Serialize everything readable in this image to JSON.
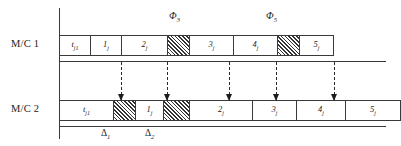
{
  "diagram": {
    "machines": [
      {
        "id": "mc1",
        "label": "M/C 1",
        "row_label_name": "machine-1-label",
        "cells": [
          {
            "name": "mc1-cell-tj1",
            "text": "t",
            "sub": "j1",
            "type": "task",
            "x": 0,
            "w": 31
          },
          {
            "name": "mc1-cell-1j",
            "text": "1",
            "sub": "j",
            "type": "task",
            "x": 31,
            "w": 31
          },
          {
            "name": "mc1-cell-2j",
            "text": "2",
            "sub": "j",
            "type": "task",
            "x": 62,
            "w": 46
          },
          {
            "name": "mc1-block-phi3",
            "text": "",
            "sub": "",
            "type": "hatched",
            "x": 108,
            "w": 22
          },
          {
            "name": "mc1-cell-3j",
            "text": "3",
            "sub": "j",
            "type": "task",
            "x": 130,
            "w": 44
          },
          {
            "name": "mc1-cell-4j",
            "text": "4",
            "sub": "j",
            "type": "task",
            "x": 174,
            "w": 44
          },
          {
            "name": "mc1-block-phi5",
            "text": "",
            "sub": "",
            "type": "hatched",
            "x": 218,
            "w": 22
          },
          {
            "name": "mc1-cell-5j",
            "text": "5",
            "sub": "j",
            "type": "task",
            "x": 240,
            "w": 34
          }
        ]
      },
      {
        "id": "mc2",
        "label": "M/C 2",
        "row_label_name": "machine-2-label",
        "cells": [
          {
            "name": "mc2-cell-tj1",
            "text": "t",
            "sub": "j1",
            "type": "task",
            "x": 0,
            "w": 54
          },
          {
            "name": "mc2-block-delta1",
            "text": "",
            "sub": "",
            "type": "hatched",
            "x": 54,
            "w": 22
          },
          {
            "name": "mc2-cell-1j",
            "text": "1",
            "sub": "j",
            "type": "task",
            "x": 76,
            "w": 28
          },
          {
            "name": "mc2-block-delta2",
            "text": "",
            "sub": "",
            "type": "hatched",
            "x": 104,
            "w": 26
          },
          {
            "name": "mc2-cell-2j",
            "text": "2",
            "sub": "j",
            "type": "task",
            "x": 130,
            "w": 63
          },
          {
            "name": "mc2-cell-3j",
            "text": "3",
            "sub": "j",
            "type": "task",
            "x": 193,
            "w": 44
          },
          {
            "name": "mc2-cell-4j",
            "text": "4",
            "sub": "j",
            "type": "task",
            "x": 237,
            "w": 49
          },
          {
            "name": "mc2-cell-5j",
            "text": "5",
            "sub": "j",
            "type": "task",
            "x": 286,
            "w": 55
          }
        ]
      }
    ],
    "phi_annotations": [
      {
        "name": "phi-3-label",
        "text": "Φ",
        "sub": "3",
        "x": 169,
        "y": 10
      },
      {
        "name": "phi-5-label",
        "text": "Φ",
        "sub": "5",
        "x": 266,
        "y": 10
      }
    ],
    "delta_annotations": [
      {
        "name": "delta-1-label",
        "text": "Δ",
        "sub": "1",
        "x": 101,
        "y": 128
      },
      {
        "name": "delta-2-label",
        "text": "Δ",
        "sub": "2",
        "x": 145,
        "y": 128
      }
    ],
    "arrows": [
      {
        "name": "dependency-arrow-1",
        "x": 121
      },
      {
        "name": "dependency-arrow-2",
        "x": 167
      },
      {
        "name": "dependency-arrow-3",
        "x": 229
      },
      {
        "name": "dependency-arrow-4",
        "x": 276
      },
      {
        "name": "dependency-arrow-5",
        "x": 334
      }
    ],
    "axes": {
      "vertical_axis_name": "time-axis-vertical",
      "machine1_baseline_name": "machine-1-baseline",
      "machine2_baseline_name": "machine-2-baseline"
    }
  }
}
